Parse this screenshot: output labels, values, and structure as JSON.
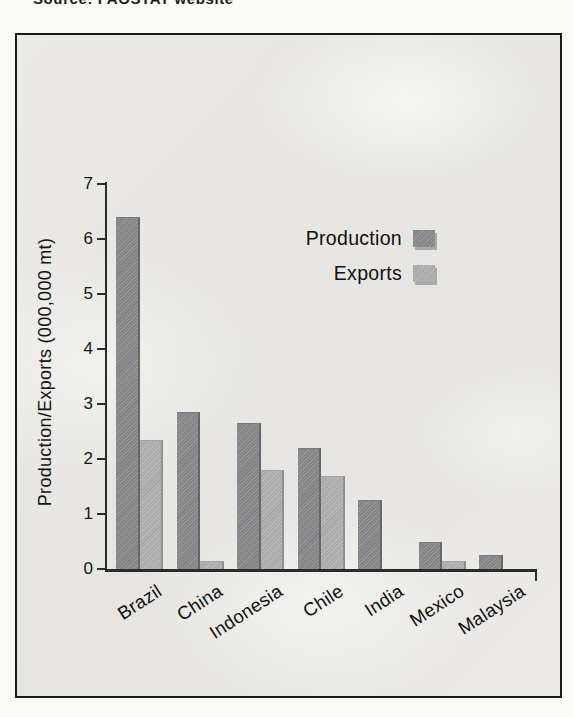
{
  "caption": "Source: FAOSTAT website",
  "chart_data": {
    "type": "bar",
    "title": "",
    "categories": [
      "Brazil",
      "China",
      "Indonesia",
      "Chile",
      "India",
      "Mexico",
      "Malaysia"
    ],
    "series": [
      {
        "name": "Production",
        "values": [
          6.4,
          2.85,
          2.65,
          2.2,
          1.25,
          0.5,
          0.25
        ]
      },
      {
        "name": "Exports",
        "values": [
          2.35,
          0.15,
          1.8,
          1.7,
          0,
          0.15,
          0
        ]
      }
    ],
    "xlabel": "",
    "ylabel": "Production/Exports (000,000 mt)",
    "ylim": [
      0,
      7
    ],
    "yticks": [
      "0",
      "1",
      "2",
      "3",
      "4",
      "5",
      "6",
      "7"
    ],
    "legend_position": "upper right",
    "grid": false,
    "colors": {
      "production": "#8d8d8f",
      "exports": "#b2b2b3",
      "axis": "#2b2b2b",
      "frame_border": "#1b1b1b"
    }
  }
}
